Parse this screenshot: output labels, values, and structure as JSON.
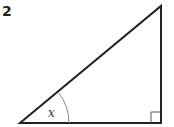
{
  "problem": {
    "number": "2"
  },
  "diagram": {
    "type": "right-triangle",
    "angle_label": "x",
    "right_angle_marker": true,
    "vertices": {
      "bottom_left": [
        20,
        123
      ],
      "bottom_right": [
        161,
        123
      ],
      "top_right": [
        161,
        6
      ]
    },
    "colors": {
      "stroke": "#222222",
      "arc": "#888888",
      "marker": "#555555"
    }
  }
}
